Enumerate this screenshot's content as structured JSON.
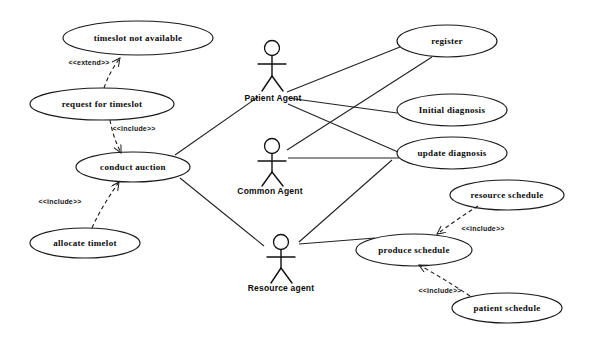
{
  "diagram": {
    "type": "uml-use-case-diagram",
    "background_color": "#ffffff",
    "stroke_color": "#1a1a1a",
    "width": 597,
    "height": 339
  },
  "use_cases": [
    {
      "id": "timeslot_not_available",
      "label": "timeslot not available",
      "cx": 138,
      "cy": 38,
      "rx": 75,
      "ry": 17
    },
    {
      "id": "request_for_timeslot",
      "label": "request for timeslot",
      "cx": 102,
      "cy": 104,
      "rx": 72,
      "ry": 16
    },
    {
      "id": "conduct_auction",
      "label": "conduct auction",
      "cx": 133,
      "cy": 167,
      "rx": 57,
      "ry": 15
    },
    {
      "id": "allocate_timelot",
      "label": "allocate timelot",
      "cx": 85,
      "cy": 243,
      "rx": 55,
      "ry": 15
    },
    {
      "id": "register",
      "label": "register",
      "cx": 447,
      "cy": 41,
      "rx": 50,
      "ry": 16
    },
    {
      "id": "initial_diagnosis",
      "label": "Initial diagnosis",
      "cx": 452,
      "cy": 110,
      "rx": 55,
      "ry": 16
    },
    {
      "id": "update_diagnosis",
      "label": "update diagnosis",
      "cx": 452,
      "cy": 153,
      "rx": 55,
      "ry": 16
    },
    {
      "id": "resource_schedule",
      "label": "resource schedule",
      "cx": 507,
      "cy": 195,
      "rx": 57,
      "ry": 15
    },
    {
      "id": "produce_schedule",
      "label": "produce schedule",
      "cx": 414,
      "cy": 250,
      "rx": 58,
      "ry": 16
    },
    {
      "id": "patient_schedule",
      "label": "patient schedule",
      "cx": 507,
      "cy": 308,
      "rx": 55,
      "ry": 15
    }
  ],
  "actors": [
    {
      "id": "patient_agent",
      "label": "Patient Agent",
      "x": 272,
      "y": 55,
      "label_x": 273,
      "label_y": 98
    },
    {
      "id": "common_agent",
      "label": "Common Agent",
      "x": 272,
      "y": 152,
      "label_x": 270,
      "label_y": 191
    },
    {
      "id": "resource_agent",
      "label": "Resource agent",
      "x": 281,
      "y": 248,
      "label_x": 281,
      "label_y": 288
    }
  ],
  "relationships": [
    {
      "id": "extend_timeslot",
      "stereotype": "<<extend>>",
      "from": "request_for_timeslot",
      "to": "timeslot_not_available",
      "label_x": 89,
      "label_y": 62
    },
    {
      "id": "include_conduct",
      "stereotype": "<<include>>",
      "from": "request_for_timeslot",
      "to": "conduct_auction",
      "label_x": 134,
      "label_y": 128
    },
    {
      "id": "include_allocate",
      "stereotype": "<<include>>",
      "from": "allocate_timelot",
      "to": "conduct_auction",
      "label_x": 60,
      "label_y": 201
    },
    {
      "id": "include_resource_sched",
      "stereotype": "<<include>>",
      "from": "resource_schedule",
      "to": "produce_schedule",
      "label_x": 483,
      "label_y": 228
    },
    {
      "id": "include_patient_sched",
      "stereotype": "<<include>>",
      "from": "patient_schedule",
      "to": "produce_schedule",
      "label_x": 440,
      "label_y": 290
    }
  ],
  "associations": [
    {
      "id": "patient_register",
      "actor": "patient_agent",
      "use_case": "register"
    },
    {
      "id": "patient_initial_diagnosis",
      "actor": "patient_agent",
      "use_case": "initial_diagnosis"
    },
    {
      "id": "patient_update_diagnosis",
      "actor": "patient_agent",
      "use_case": "update_diagnosis"
    },
    {
      "id": "patient_conduct_auction",
      "actor": "patient_agent",
      "use_case": "conduct_auction"
    },
    {
      "id": "common_register",
      "actor": "common_agent",
      "use_case": "register"
    },
    {
      "id": "common_update_diagnosis",
      "actor": "common_agent",
      "use_case": "update_diagnosis"
    },
    {
      "id": "resource_conduct_auction",
      "actor": "resource_agent",
      "use_case": "conduct_auction"
    },
    {
      "id": "resource_produce_schedule",
      "actor": "resource_agent",
      "use_case": "produce_schedule"
    }
  ]
}
